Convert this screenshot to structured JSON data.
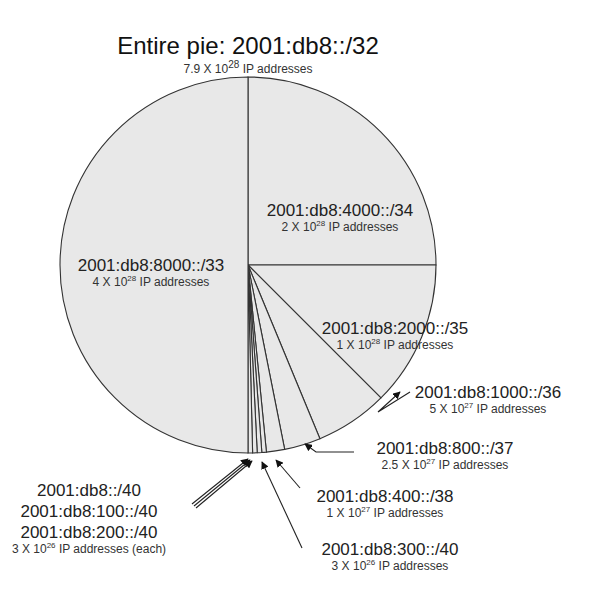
{
  "chart_data": {
    "type": "pie",
    "title": "Entire pie: 2001:db8::/32",
    "subtitle": "7.9 X 10^28 IP addresses",
    "total_addresses": "7.9 X 10^28",
    "center": [
      248,
      265
    ],
    "radius": 188,
    "start_angle_deg": 0,
    "direction": "clockwise",
    "fill_color": "#e8e8e8",
    "stroke_color": "#333333",
    "legend": "none (direct labels)",
    "slices": [
      {
        "prefix": "2001:db8:4000::/34",
        "fraction": 0.25,
        "addresses": "2 X 10^28 IP addresses"
      },
      {
        "prefix": "2001:db8:2000::/35",
        "fraction": 0.125,
        "addresses": "1 X 10^28 IP addresses"
      },
      {
        "prefix": "2001:db8:1000::/36",
        "fraction": 0.0625,
        "addresses": "5 X 10^27 IP addresses"
      },
      {
        "prefix": "2001:db8:800::/37",
        "fraction": 0.03125,
        "addresses": "2.5 X 10^27 IP addresses"
      },
      {
        "prefix": "2001:db8:400::/38",
        "fraction": 0.015625,
        "addresses": "1 X 10^27 IP addresses"
      },
      {
        "prefix": "2001:db8:300::/40",
        "fraction": 0.00390625,
        "addresses": "3 X 10^26 IP addresses"
      },
      {
        "prefix": "2001:db8:200::/40",
        "fraction": 0.00390625,
        "addresses": "3 X 10^26 IP addresses (each)"
      },
      {
        "prefix": "2001:db8:100::/40",
        "fraction": 0.00390625,
        "addresses": "3 X 10^26 IP addresses (each)"
      },
      {
        "prefix": "2001:db8::/40",
        "fraction": 0.00390625,
        "addresses": "3 X 10^26 IP addresses (each)"
      },
      {
        "prefix": "2001:db8:8000::/33",
        "fraction": 0.5,
        "addresses": "4 X 10^28 IP addresses"
      }
    ]
  },
  "labels": {
    "title": {
      "main": "Entire pie: 2001:db8::/32",
      "sub_mant": "7.9 X 10",
      "sub_exp": "28",
      "sub_tail": " IP addresses"
    },
    "s33": {
      "prefix": "2001:db8:8000::/33",
      "mant": "4 X 10",
      "exp": "28",
      "tail": " IP addresses"
    },
    "s34": {
      "prefix": "2001:db8:4000::/34",
      "mant": "2 X 10",
      "exp": "28",
      "tail": " IP addresses"
    },
    "s35": {
      "prefix": "2001:db8:2000::/35",
      "mant": "1 X 10",
      "exp": "28",
      "tail": " IP addresses"
    },
    "s36": {
      "prefix": "2001:db8:1000::/36",
      "mant": "5 X 10",
      "exp": "27",
      "tail": " IP addresses"
    },
    "s37": {
      "prefix": "2001:db8:800::/37",
      "mant": "2.5 X 10",
      "exp": "27",
      "tail": " IP addresses"
    },
    "s38": {
      "prefix": "2001:db8:400::/38",
      "mant": "1 X 10",
      "exp": "27",
      "tail": " IP addresses"
    },
    "s300": {
      "prefix": "2001:db8:300::/40",
      "mant": "3 X 10",
      "exp": "26",
      "tail": " IP addresses"
    },
    "s40group": {
      "line1": "2001:db8::/40",
      "line2": "2001:db8:100::/40",
      "line3": "2001:db8:200::/40",
      "mant": "3 X 10",
      "exp": "26",
      "tail": " IP addresses (each)"
    }
  }
}
